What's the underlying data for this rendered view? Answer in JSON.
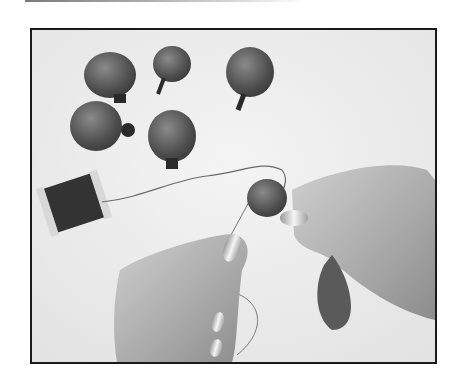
{
  "image": {
    "kind": "photograph",
    "style": "grayscale",
    "subject": "hands assembling fabric petals on thread next to a thread spool",
    "frame_color": "#1a1a1a",
    "background_color": "#eeeeee"
  },
  "scene": {
    "petals_loose": 5,
    "spool": "thread-spool",
    "hands": 2,
    "petal_in_hand": 1
  }
}
